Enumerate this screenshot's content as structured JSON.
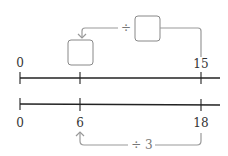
{
  "diagram": {
    "title": "",
    "top_line": {
      "ticks": [
        {
          "label": "0",
          "value": 0
        },
        {
          "label": "",
          "value": null,
          "blank_box": true
        },
        {
          "label": "15",
          "value": 15
        }
      ]
    },
    "bottom_line": {
      "ticks": [
        {
          "label": "0",
          "value": 0
        },
        {
          "label": "6",
          "value": 6
        },
        {
          "label": "18",
          "value": 18
        }
      ]
    },
    "top_operation": {
      "symbol": "÷",
      "divisor_box": "",
      "from": "15",
      "to": "blank"
    },
    "bottom_operation": {
      "label": "÷ 3",
      "from": "18",
      "to": "6"
    },
    "colors": {
      "line": "#222222",
      "connector": "#999999",
      "box_stroke": "#888888"
    }
  }
}
